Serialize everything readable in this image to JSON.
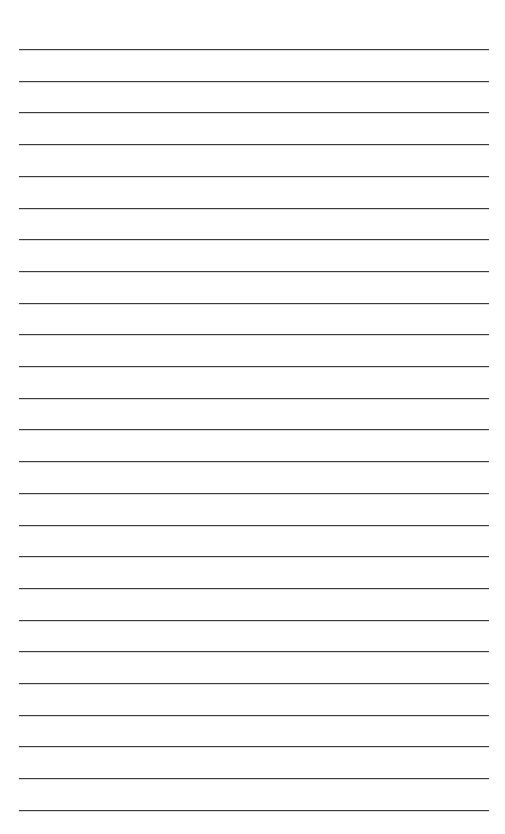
{
  "document": {
    "kind": "lined-notebook-paper",
    "title": "Blank Ruled Paper",
    "page_width_px": 505,
    "page_height_px": 834,
    "background_color": "#ffffff",
    "orientation": "portrait"
  },
  "ruling": {
    "line_color": "#3b3b3b",
    "line_thickness_px": 1.6,
    "line_count": 25,
    "line_left_px": 19,
    "line_right_px": 489,
    "line_length_px": 470,
    "first_line_y_px": 49,
    "last_line_y_px": 809,
    "line_spacing_px": 31.7,
    "style": "wide-ruled",
    "has_margin_rule": false,
    "has_header_rule": false,
    "line_y_positions_px": [
      49,
      80.7,
      112.4,
      144.1,
      175.8,
      207.5,
      239.2,
      270.9,
      302.6,
      334.3,
      366,
      397.7,
      429.4,
      461.1,
      492.8,
      524.5,
      556.2,
      587.9,
      619.6,
      651.3,
      683,
      714.7,
      746.4,
      778.1,
      809.8
    ]
  },
  "margins": {
    "top_px": 49,
    "bottom_px": 24,
    "left_px": 19,
    "right_px": 16
  },
  "content": {
    "written_text": "",
    "annotations": [],
    "note": ""
  }
}
